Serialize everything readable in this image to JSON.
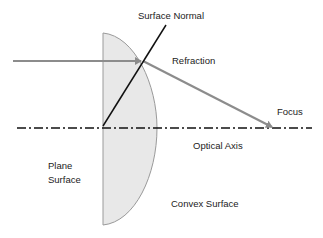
{
  "labels": {
    "surface_normal": "Surface Normal",
    "refraction": "Refraction",
    "focus": "Focus",
    "optical_axis": "Optical Axis",
    "plane_surface_line1": "Plane",
    "plane_surface_line2": "Surface",
    "convex_surface": "Convex Surface"
  },
  "colors": {
    "lens_fill": "#e8e8e8",
    "lens_stroke": "#9a9a9a",
    "ray": "#8c8c8c",
    "normal": "#111111",
    "axis": "#111111",
    "text": "#222222"
  }
}
